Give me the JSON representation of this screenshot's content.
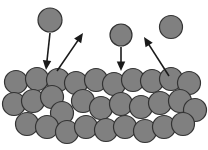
{
  "figure": {
    "width": 208,
    "height": 150,
    "background_color": "#ffffff"
  },
  "style": {
    "particle_fill": "#808080",
    "particle_stroke": "#333333",
    "particle_stroke_width": 1.2,
    "arrow_color": "#1a1a1a",
    "arrow_width": 1.6,
    "arrow_head_size": 5
  },
  "chart_data": {
    "type": "scatter",
    "xlabel": "",
    "ylabel": "",
    "xlim": [
      0,
      208
    ],
    "ylim": [
      0,
      150
    ],
    "grid": false,
    "legend": "none",
    "series": [
      {
        "name": "free-particles",
        "radius": 11.5,
        "points": [
          {
            "x": 50,
            "y": 20,
            "r": 12
          },
          {
            "x": 121,
            "y": 35,
            "r": 11
          },
          {
            "x": 171,
            "y": 27,
            "r": 11.5
          }
        ]
      },
      {
        "name": "bulk-surface-row",
        "radius": 11.5,
        "points": [
          {
            "x": 16,
            "y": 82,
            "r": 11.5
          },
          {
            "x": 37,
            "y": 79,
            "r": 11.5
          },
          {
            "x": 58,
            "y": 80,
            "r": 11.5
          },
          {
            "x": 76,
            "y": 83,
            "r": 11.5
          },
          {
            "x": 96,
            "y": 80,
            "r": 11.5
          },
          {
            "x": 114,
            "y": 84,
            "r": 11.5
          },
          {
            "x": 133,
            "y": 80,
            "r": 11.5
          },
          {
            "x": 152,
            "y": 81,
            "r": 11.5
          },
          {
            "x": 171,
            "y": 79,
            "r": 11.5
          },
          {
            "x": 189,
            "y": 83,
            "r": 11.5
          }
        ]
      },
      {
        "name": "bulk-middle-row",
        "radius": 11.5,
        "points": [
          {
            "x": 14,
            "y": 104,
            "r": 11.5
          },
          {
            "x": 33,
            "y": 101,
            "r": 11.5
          },
          {
            "x": 52,
            "y": 97,
            "r": 11.5
          },
          {
            "x": 62,
            "y": 113,
            "r": 11.5
          },
          {
            "x": 83,
            "y": 101,
            "r": 11.5
          },
          {
            "x": 101,
            "y": 108,
            "r": 11.5
          },
          {
            "x": 121,
            "y": 104,
            "r": 11.5
          },
          {
            "x": 141,
            "y": 107,
            "r": 11.5
          },
          {
            "x": 160,
            "y": 103,
            "r": 11.5
          },
          {
            "x": 180,
            "y": 101,
            "r": 11.5
          },
          {
            "x": 195,
            "y": 110,
            "r": 11.5
          }
        ]
      },
      {
        "name": "bulk-bottom-row",
        "radius": 11.5,
        "points": [
          {
            "x": 27,
            "y": 124,
            "r": 11.5
          },
          {
            "x": 47,
            "y": 127,
            "r": 11.5
          },
          {
            "x": 67,
            "y": 132,
            "r": 11.5
          },
          {
            "x": 86,
            "y": 127,
            "r": 11.5
          },
          {
            "x": 106,
            "y": 130,
            "r": 11.5
          },
          {
            "x": 125,
            "y": 127,
            "r": 11.5
          },
          {
            "x": 145,
            "y": 131,
            "r": 11.5
          },
          {
            "x": 164,
            "y": 127,
            "r": 11.5
          },
          {
            "x": 183,
            "y": 124,
            "r": 11.5
          }
        ]
      }
    ],
    "annotations": [
      {
        "name": "incoming-left",
        "kind": "arrow",
        "direction": "down",
        "x1": 50,
        "y1": 33,
        "x2": 46,
        "y2": 70
      },
      {
        "name": "outgoing-left",
        "kind": "arrow",
        "direction": "up-right",
        "x1": 57,
        "y1": 71,
        "x2": 83,
        "y2": 33
      },
      {
        "name": "incoming-right",
        "kind": "arrow",
        "direction": "down",
        "x1": 121,
        "y1": 47,
        "x2": 121,
        "y2": 71
      },
      {
        "name": "outgoing-right",
        "kind": "arrow",
        "direction": "up-left",
        "x1": 169,
        "y1": 76,
        "x2": 144,
        "y2": 37
      }
    ]
  }
}
